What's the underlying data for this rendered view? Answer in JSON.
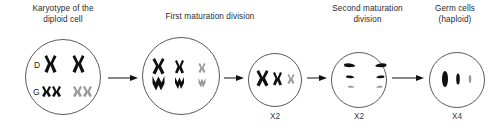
{
  "diagram": {
    "title_sequence": [
      "Karyotype of the diploid cell",
      "First maturation division",
      "Second maturation division",
      "Germ cells (haploid)"
    ],
    "captions": {
      "cell1": "Karyotype of the\ndiploid cell",
      "cell2": "First maturation division",
      "cell4": "Second maturation\ndivision",
      "cell5": "Germ cells\n(haploid)"
    },
    "row_labels": {
      "d": "D",
      "g": "G"
    },
    "multipliers": {
      "cell3": "X2",
      "cell4": "X2",
      "cell5": "X4"
    },
    "colors": {
      "chromosome_dark": "#101010",
      "chromosome_gray": "#9a9a9a",
      "cell_outline": "#5a5a5a",
      "arrow": "#111111",
      "text": "#2b2b2b",
      "background": "#ffffff"
    },
    "cells": [
      {
        "name": "diploid-cell",
        "stage": "Karyotype of the diploid cell",
        "chromosome_count": 6,
        "rows": [
          {
            "label": "D",
            "items": [
              "dark-large",
              "dark-large"
            ]
          },
          {
            "label": "G",
            "items": [
              "dark-small",
              "dark-small",
              "gray-small",
              "gray-small"
            ]
          }
        ]
      },
      {
        "name": "first-division-cell",
        "stage": "First maturation division",
        "chromosome_count": 6,
        "pairs": [
          "dark-large-pair",
          "dark-medium-pair",
          "gray-small-pair"
        ]
      },
      {
        "name": "post-first-division-cell",
        "stage": "After first maturation division",
        "chromosome_count": 3,
        "items": [
          "dark-large",
          "dark-medium",
          "gray-small"
        ],
        "multiplier": "X2"
      },
      {
        "name": "second-division-cell",
        "stage": "Second maturation division",
        "chromosome_count": 6,
        "items": [
          "chromatid-pair-large",
          "chromatid-pair-medium",
          "chromatid-pair-small"
        ],
        "multiplier": "X2"
      },
      {
        "name": "germ-cell",
        "stage": "Germ cells (haploid)",
        "chromosome_count": 3,
        "items": [
          "rod-large",
          "rod-medium",
          "rod-small"
        ],
        "multiplier": "X4"
      }
    ],
    "arrows": [
      {
        "from": "diploid-cell",
        "to": "first-division-cell"
      },
      {
        "from": "first-division-cell",
        "to": "post-first-division-cell"
      },
      {
        "from": "post-first-division-cell",
        "to": "second-division-cell"
      },
      {
        "from": "second-division-cell",
        "to": "germ-cell"
      }
    ]
  }
}
